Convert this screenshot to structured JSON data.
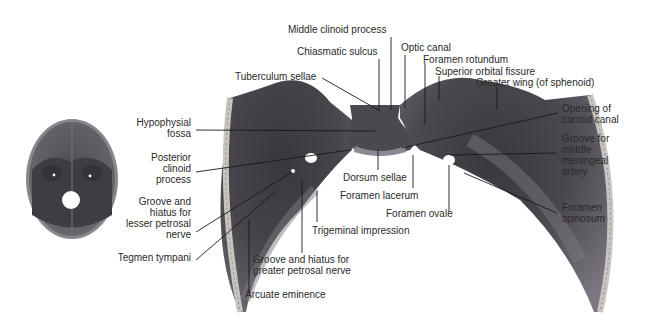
{
  "figure": {
    "thumbnail": "Interior of skull base, superior view",
    "colors": {
      "background": "#ffffff",
      "bone_dark": "#3c3a3f",
      "bone_mid": "#5e5a63",
      "bone_light": "#8a858e",
      "skull_rim": "#c9c6c4",
      "leader_line": "#1a1a1a",
      "text": "#2a2a2a"
    }
  },
  "labels": {
    "top": [
      {
        "id": "middle-clinoid-process",
        "text": "Middle clinoid process"
      },
      {
        "id": "chiasmatic-sulcus",
        "text": "Chiasmatic sulcus"
      },
      {
        "id": "optic-canal",
        "text": "Optic canal"
      },
      {
        "id": "foramen-rotundum",
        "text": "Foramen rotundum"
      },
      {
        "id": "superior-orbital-fissure",
        "text": "Superior orbital fissure"
      },
      {
        "id": "greater-wing",
        "text": "Greater wing (of sphenoid)"
      },
      {
        "id": "tuberculum-sellae",
        "text": "Tuberculum sellae"
      }
    ],
    "left": [
      {
        "id": "hypophysial-fossa",
        "lines": [
          "Hypophysial",
          "fossa"
        ]
      },
      {
        "id": "posterior-clinoid-process",
        "lines": [
          "Posterior",
          "clinoid",
          "process"
        ]
      },
      {
        "id": "groove-lesser-petrosal",
        "lines": [
          "Groove and",
          "hiatus for",
          "lesser petrosal",
          "nerve"
        ]
      },
      {
        "id": "tegmen-tympani",
        "lines": [
          "Tegmen tympani"
        ]
      }
    ],
    "right": [
      {
        "id": "opening-carotid-canal",
        "lines": [
          "Opening of",
          "carotid canal"
        ]
      },
      {
        "id": "groove-middle-meningeal",
        "lines": [
          "Groove for",
          "middle",
          "meningeal",
          "artery"
        ]
      },
      {
        "id": "foramen-spinosum",
        "lines": [
          "Foramen",
          "spinosum"
        ]
      }
    ],
    "bottom": [
      {
        "id": "dorsum-sellae",
        "text": "Dorsum sellae"
      },
      {
        "id": "foramen-lacerum",
        "text": "Foramen lacerum"
      },
      {
        "id": "foramen-ovale",
        "text": "Foramen ovale"
      },
      {
        "id": "trigeminal-impression",
        "text": "Trigeminal impression"
      },
      {
        "id": "groove-greater-petrosal",
        "lines": [
          "Groove and hiatus for",
          "greater petrosal nerve"
        ]
      },
      {
        "id": "arcuate-eminence",
        "text": "Arcuate eminence"
      }
    ]
  }
}
